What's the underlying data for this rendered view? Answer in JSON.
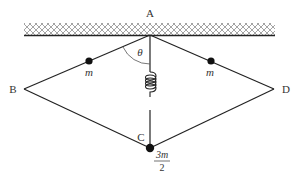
{
  "labels": {
    "A": "A",
    "B": "B",
    "C": "C",
    "D": "D",
    "theta": "θ",
    "mass_left": "m",
    "mass_right": "m",
    "mass_bottom_num": "3m",
    "mass_bottom_den": "2"
  },
  "colors": {
    "line": "#222222",
    "hatch": "#555555",
    "text": "#333333"
  }
}
